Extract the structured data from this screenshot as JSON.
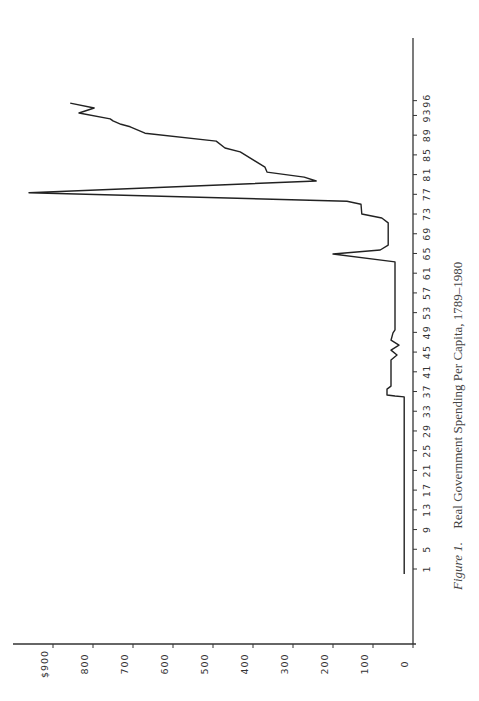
{
  "chart_data": {
    "type": "line",
    "orientation": "rotated-90-ccw",
    "title": "Real Government Spending Per Capita, 1789–1980",
    "caption_prefix": "Figure  1.",
    "caption_text": "Real Government Spending Per Capita, 1789–1980",
    "xlabel": "",
    "ylabel": "",
    "x_tick_labels": [
      "1",
      "5",
      "9",
      "13",
      "17",
      "21",
      "25",
      "29",
      "33",
      "37",
      "41",
      "45",
      "49",
      "53",
      "57",
      "61",
      "65",
      "69",
      "73",
      "77",
      "81",
      "85",
      "89",
      "93",
      "96"
    ],
    "x_tick_positions": [
      1,
      5,
      9,
      13,
      17,
      21,
      25,
      29,
      33,
      37,
      41,
      45,
      49,
      53,
      57,
      61,
      65,
      69,
      73,
      77,
      81,
      85,
      89,
      93,
      96
    ],
    "y_tick_labels": [
      "0",
      "100",
      "200",
      "300",
      "400",
      "500",
      "600",
      "700",
      "800",
      "$900"
    ],
    "y_tick_values": [
      0,
      100,
      200,
      300,
      400,
      500,
      600,
      700,
      800,
      900
    ],
    "ylim": [
      0,
      1000
    ],
    "xlim": [
      -1,
      100
    ],
    "grid": false,
    "series": [
      {
        "name": "Real government spending per capita",
        "points": [
          [
            0,
            22
          ],
          [
            35.9,
            22
          ],
          [
            36.1,
            45
          ],
          [
            36.3,
            65
          ],
          [
            37.5,
            65
          ],
          [
            38.1,
            55
          ],
          [
            43.4,
            55
          ],
          [
            44.4,
            40
          ],
          [
            45.4,
            55
          ],
          [
            46.4,
            35
          ],
          [
            47.4,
            55
          ],
          [
            48.9,
            50
          ],
          [
            49.5,
            45
          ],
          [
            63.3,
            45
          ],
          [
            64.9,
            200
          ],
          [
            65.7,
            82
          ],
          [
            66.7,
            62
          ],
          [
            71.2,
            62
          ],
          [
            72.2,
            78
          ],
          [
            73.0,
            128
          ],
          [
            75.0,
            130
          ],
          [
            75.6,
            165
          ],
          [
            77.3,
            960
          ],
          [
            79.7,
            242
          ],
          [
            80.5,
            272
          ],
          [
            81.5,
            365
          ],
          [
            82.5,
            370
          ],
          [
            85.6,
            432
          ],
          [
            86.4,
            470
          ],
          [
            87.8,
            492
          ],
          [
            89.4,
            670
          ],
          [
            90.7,
            707
          ],
          [
            91.2,
            730
          ],
          [
            91.9,
            750
          ],
          [
            92.3,
            757
          ],
          [
            93.5,
            835
          ],
          [
            94.5,
            797
          ],
          [
            95.5,
            857
          ]
        ]
      }
    ]
  }
}
